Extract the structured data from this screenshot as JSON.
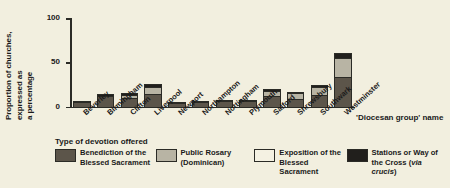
{
  "chart_data": {
    "type": "bar",
    "stacked": true,
    "title": "",
    "ylabel": "Proportion of churches,\nexpressed as\na percentage",
    "xlabel": "'Diocesan group' name",
    "ylim": [
      0,
      100
    ],
    "yticks": [
      "0",
      "50",
      "100"
    ],
    "ytick_values": [
      0,
      50,
      100
    ],
    "grid": false,
    "legend_title": "Type of devotion offered",
    "legend_position": "bottom",
    "categories": [
      "Beverley",
      "Birmingham",
      "Clifton",
      "Liverpool",
      "Newport",
      "Northampton",
      "Nottingham",
      "Plymouth",
      "Salford",
      "Shrewsbury",
      "Southwark",
      "Westminster"
    ],
    "series": [
      {
        "name": "Benediction of the Blessed Sacrament",
        "color": "#5c554a",
        "values": [
          5,
          12,
          9,
          14,
          4,
          5,
          6,
          6,
          11,
          8,
          13,
          33
        ]
      },
      {
        "name": "Public Rosary (Dominican)",
        "color": "#b8b4a4",
        "values": [
          0,
          0,
          4,
          8,
          0,
          0,
          0,
          0,
          7,
          7,
          9,
          22
        ]
      },
      {
        "name": "Exposition of the Blessed Sacrament",
        "color": "#f4f1e2",
        "values": [
          0,
          0,
          0,
          0,
          0,
          0,
          0,
          0,
          0,
          0,
          0,
          0
        ]
      },
      {
        "name": "Stations or Way of the Cross (via crucis)",
        "color": "#211f1c",
        "values": [
          1,
          2,
          2,
          4,
          1,
          1,
          1,
          1,
          2,
          1,
          2,
          5
        ]
      }
    ]
  },
  "legend": {
    "title": "Type of devotion offered",
    "items": [
      {
        "label": "Benediction of the\nBlessed Sacrament",
        "color": "#5c554a"
      },
      {
        "label": "Public Rosary\n(Dominican)",
        "color": "#b8b4a4"
      },
      {
        "label": "Exposition of the\nBlessed Sacrament",
        "color": "#f4f1e2"
      },
      {
        "label": "Stations or Way of\nthe Cross (via crucis)",
        "color": "#211f1c"
      }
    ]
  },
  "axes": {
    "y_title": "Proportion of churches,\nexpressed as\na percentage",
    "x_title": "'Diocesan group' name",
    "y_ticks": [
      "100",
      "50",
      "0"
    ]
  }
}
